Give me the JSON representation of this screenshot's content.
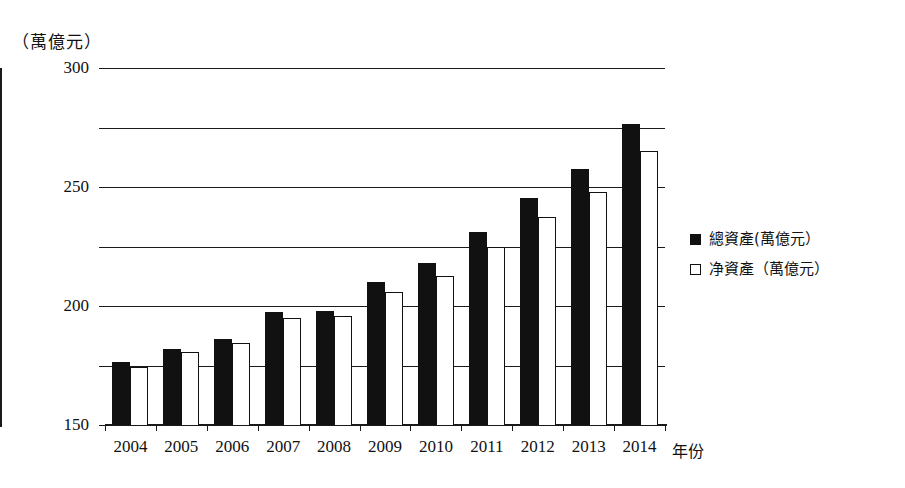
{
  "chart_data": {
    "type": "bar",
    "title": "",
    "subtitle": "",
    "xlabel": "年份",
    "ylabel": "（萬億元）",
    "ylim": [
      0,
      300
    ],
    "yticks": [
      0,
      50,
      100,
      150,
      200,
      250,
      300
    ],
    "ytick_labels": [
      "0",
      "50",
      "100",
      "150",
      "200",
      "250",
      "300"
    ],
    "grid": true,
    "legend_position": "right",
    "categories": [
      "2004",
      "2005",
      "2006",
      "2007",
      "2008",
      "2009",
      "2010",
      "2011",
      "2012",
      "2013",
      "2014"
    ],
    "series": [
      {
        "name": "總資產(萬億元）",
        "color": "#111111",
        "style": "filled",
        "values": [
          53,
          64,
          72,
          95,
          96,
          120,
          136,
          162,
          191,
          215,
          253
        ]
      },
      {
        "name": "净資產（萬億元）",
        "color": "#ffffff",
        "style": "hollow",
        "values": [
          49,
          61,
          69,
          90,
          92,
          112,
          125,
          150,
          175,
          196,
          230
        ]
      }
    ]
  },
  "legend": {
    "items": [
      {
        "marker": "filled-square-marker",
        "label": "總資產(萬億元）"
      },
      {
        "marker": "hollow-square-marker",
        "label": "净資產（萬億元）"
      }
    ]
  },
  "axes": {
    "y_unit_caption": "（萬億元）",
    "x_axis_title": "年份"
  }
}
